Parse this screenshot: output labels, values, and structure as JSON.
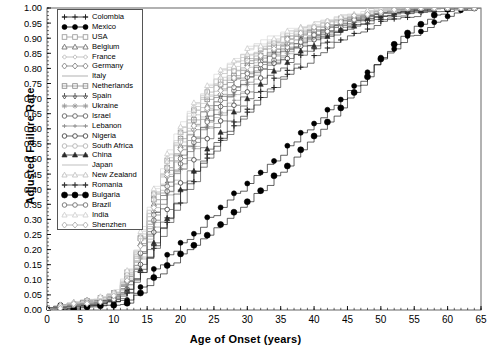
{
  "chart_data": {
    "type": "line",
    "subtype": "step-cumulative-incidence",
    "title": "",
    "xlabel": "Age of Onset (years)",
    "ylabel": "Adjusted Failure Rate",
    "xlim": [
      0,
      65
    ],
    "ylim": [
      0.0,
      1.0
    ],
    "xticks": [
      0,
      5,
      10,
      15,
      20,
      25,
      30,
      35,
      40,
      45,
      50,
      55,
      60,
      65
    ],
    "xtick_labels": [
      "0",
      "5",
      "10",
      "15",
      "20",
      "25",
      "30",
      "35",
      "40",
      "45",
      "50",
      "55",
      "60",
      "65"
    ],
    "x_minor_tick_interval": 1,
    "yticks": [
      0.0,
      0.05,
      0.1,
      0.15,
      0.2,
      0.25,
      0.3,
      0.35,
      0.4,
      0.45,
      0.5,
      0.55,
      0.6,
      0.65,
      0.7,
      0.75,
      0.8,
      0.85,
      0.9,
      0.95,
      1.0
    ],
    "ytick_labels": [
      "0.00",
      "0.05",
      "0.10",
      "0.15",
      "0.20",
      "0.25",
      "0.30",
      "0.35",
      "0.40",
      "0.45",
      "0.50",
      "0.55",
      "0.60",
      "0.65",
      "0.70",
      "0.75",
      "0.80",
      "0.85",
      "0.90",
      "0.95",
      "1.00"
    ],
    "grid": false,
    "legend_position": "upper-left",
    "x": [
      0,
      2,
      4,
      6,
      8,
      10,
      12,
      14,
      16,
      18,
      20,
      22,
      24,
      26,
      28,
      30,
      32,
      34,
      36,
      38,
      40,
      42,
      44,
      46,
      48,
      50,
      52,
      54,
      56,
      58,
      60,
      62,
      64,
      65
    ],
    "series": [
      {
        "name": "Colombia",
        "marker": "plus",
        "color": "#1a1a1a",
        "values": [
          0.0,
          0.01,
          0.01,
          0.02,
          0.02,
          0.03,
          0.06,
          0.13,
          0.22,
          0.31,
          0.39,
          0.46,
          0.52,
          0.57,
          0.62,
          0.66,
          0.7,
          0.74,
          0.78,
          0.81,
          0.84,
          0.87,
          0.89,
          0.91,
          0.93,
          0.95,
          0.96,
          0.97,
          0.98,
          0.99,
          0.99,
          1.0,
          1.0,
          1.0
        ]
      },
      {
        "name": "Mexico",
        "marker": "filled-circle",
        "color": "#000000",
        "values": [
          0.0,
          0.01,
          0.01,
          0.01,
          0.02,
          0.02,
          0.04,
          0.08,
          0.13,
          0.18,
          0.22,
          0.26,
          0.3,
          0.34,
          0.38,
          0.42,
          0.46,
          0.5,
          0.54,
          0.58,
          0.62,
          0.66,
          0.7,
          0.74,
          0.79,
          0.83,
          0.87,
          0.9,
          0.93,
          0.95,
          0.97,
          0.99,
          1.0,
          1.0
        ]
      },
      {
        "name": "USA",
        "marker": "open-square",
        "color": "#9a9a9a",
        "values": [
          0.0,
          0.01,
          0.02,
          0.03,
          0.04,
          0.06,
          0.12,
          0.24,
          0.38,
          0.5,
          0.59,
          0.66,
          0.72,
          0.76,
          0.8,
          0.83,
          0.86,
          0.88,
          0.9,
          0.92,
          0.93,
          0.95,
          0.96,
          0.97,
          0.98,
          0.98,
          0.99,
          0.99,
          1.0,
          1.0,
          1.0,
          1.0,
          1.0,
          1.0
        ]
      },
      {
        "name": "Belgium",
        "marker": "open-triangle",
        "color": "#6e6e6e",
        "values": [
          0.0,
          0.01,
          0.02,
          0.03,
          0.04,
          0.05,
          0.11,
          0.22,
          0.35,
          0.46,
          0.55,
          0.62,
          0.68,
          0.73,
          0.77,
          0.81,
          0.84,
          0.86,
          0.89,
          0.91,
          0.92,
          0.94,
          0.95,
          0.96,
          0.97,
          0.98,
          0.99,
          0.99,
          1.0,
          1.0,
          1.0,
          1.0,
          1.0,
          1.0
        ]
      },
      {
        "name": "France",
        "marker": "open-diamond-small",
        "color": "#b5b5b5",
        "values": [
          0.0,
          0.01,
          0.02,
          0.03,
          0.04,
          0.06,
          0.12,
          0.25,
          0.39,
          0.51,
          0.6,
          0.67,
          0.73,
          0.78,
          0.82,
          0.85,
          0.87,
          0.89,
          0.91,
          0.93,
          0.94,
          0.95,
          0.96,
          0.97,
          0.98,
          0.99,
          0.99,
          1.0,
          1.0,
          1.0,
          1.0,
          1.0,
          1.0,
          1.0
        ]
      },
      {
        "name": "Germany",
        "marker": "open-diamond",
        "color": "#7d7d7d",
        "values": [
          0.0,
          0.01,
          0.02,
          0.03,
          0.04,
          0.05,
          0.1,
          0.21,
          0.33,
          0.44,
          0.53,
          0.6,
          0.66,
          0.71,
          0.76,
          0.79,
          0.83,
          0.85,
          0.88,
          0.9,
          0.92,
          0.93,
          0.95,
          0.96,
          0.97,
          0.98,
          0.99,
          0.99,
          1.0,
          1.0,
          1.0,
          1.0,
          1.0,
          1.0
        ]
      },
      {
        "name": "Italy",
        "marker": "none",
        "color": "#c8c8c8",
        "values": [
          0.0,
          0.01,
          0.02,
          0.03,
          0.04,
          0.06,
          0.13,
          0.26,
          0.4,
          0.52,
          0.61,
          0.68,
          0.74,
          0.79,
          0.83,
          0.86,
          0.88,
          0.9,
          0.92,
          0.93,
          0.95,
          0.96,
          0.97,
          0.98,
          0.98,
          0.99,
          0.99,
          1.0,
          1.0,
          1.0,
          1.0,
          1.0,
          1.0,
          1.0
        ]
      },
      {
        "name": "Netherlands",
        "marker": "open-square-cross",
        "color": "#8a8a8a",
        "values": [
          0.0,
          0.01,
          0.02,
          0.03,
          0.04,
          0.05,
          0.11,
          0.23,
          0.36,
          0.47,
          0.56,
          0.63,
          0.69,
          0.74,
          0.78,
          0.82,
          0.85,
          0.87,
          0.89,
          0.91,
          0.93,
          0.94,
          0.96,
          0.97,
          0.97,
          0.98,
          0.99,
          0.99,
          1.0,
          1.0,
          1.0,
          1.0,
          1.0,
          1.0
        ]
      },
      {
        "name": "Spain",
        "marker": "down-arrow",
        "color": "#4d4d4d",
        "values": [
          0.0,
          0.01,
          0.02,
          0.02,
          0.03,
          0.05,
          0.1,
          0.2,
          0.32,
          0.43,
          0.51,
          0.58,
          0.64,
          0.7,
          0.74,
          0.78,
          0.82,
          0.85,
          0.87,
          0.9,
          0.91,
          0.93,
          0.95,
          0.96,
          0.97,
          0.98,
          0.98,
          0.99,
          0.99,
          1.0,
          1.0,
          1.0,
          1.0,
          1.0
        ]
      },
      {
        "name": "Ukraine",
        "marker": "star",
        "color": "#999999",
        "values": [
          0.0,
          0.01,
          0.01,
          0.02,
          0.03,
          0.04,
          0.09,
          0.18,
          0.29,
          0.39,
          0.47,
          0.54,
          0.61,
          0.66,
          0.71,
          0.75,
          0.79,
          0.82,
          0.85,
          0.88,
          0.9,
          0.92,
          0.94,
          0.95,
          0.96,
          0.97,
          0.98,
          0.99,
          0.99,
          1.0,
          1.0,
          1.0,
          1.0,
          1.0
        ]
      },
      {
        "name": "Israel",
        "marker": "open-circle",
        "color": "#5c5c5c",
        "values": [
          0.0,
          0.01,
          0.01,
          0.02,
          0.03,
          0.04,
          0.09,
          0.19,
          0.3,
          0.4,
          0.49,
          0.56,
          0.62,
          0.68,
          0.72,
          0.77,
          0.8,
          0.83,
          0.86,
          0.89,
          0.91,
          0.93,
          0.94,
          0.96,
          0.97,
          0.98,
          0.98,
          0.99,
          0.99,
          1.0,
          1.0,
          1.0,
          1.0,
          1.0
        ]
      },
      {
        "name": "Lebanon",
        "marker": "plus-small",
        "color": "#858585",
        "values": [
          0.0,
          0.01,
          0.01,
          0.02,
          0.03,
          0.04,
          0.08,
          0.17,
          0.28,
          0.38,
          0.46,
          0.53,
          0.6,
          0.65,
          0.7,
          0.75,
          0.79,
          0.82,
          0.85,
          0.88,
          0.9,
          0.92,
          0.94,
          0.95,
          0.96,
          0.97,
          0.98,
          0.99,
          0.99,
          1.0,
          1.0,
          1.0,
          1.0,
          1.0
        ]
      },
      {
        "name": "Nigeria",
        "marker": "open-circle-stem",
        "color": "#404040",
        "values": [
          0.0,
          0.0,
          0.01,
          0.01,
          0.02,
          0.03,
          0.07,
          0.15,
          0.25,
          0.34,
          0.42,
          0.5,
          0.57,
          0.63,
          0.68,
          0.73,
          0.77,
          0.81,
          0.84,
          0.87,
          0.89,
          0.91,
          0.93,
          0.95,
          0.96,
          0.97,
          0.98,
          0.99,
          0.99,
          1.0,
          1.0,
          1.0,
          1.0,
          1.0
        ]
      },
      {
        "name": "South Africa",
        "marker": "open-circle-light",
        "color": "#b0b0b0",
        "values": [
          0.0,
          0.01,
          0.02,
          0.03,
          0.04,
          0.05,
          0.11,
          0.23,
          0.36,
          0.47,
          0.56,
          0.64,
          0.7,
          0.75,
          0.79,
          0.83,
          0.86,
          0.88,
          0.9,
          0.92,
          0.94,
          0.95,
          0.96,
          0.97,
          0.98,
          0.99,
          0.99,
          1.0,
          1.0,
          1.0,
          1.0,
          1.0,
          1.0,
          1.0
        ]
      },
      {
        "name": "China",
        "marker": "filled-triangle",
        "color": "#2b2b2b",
        "values": [
          0.0,
          0.0,
          0.01,
          0.01,
          0.02,
          0.03,
          0.06,
          0.13,
          0.22,
          0.31,
          0.39,
          0.46,
          0.53,
          0.59,
          0.65,
          0.7,
          0.75,
          0.79,
          0.82,
          0.86,
          0.88,
          0.91,
          0.93,
          0.94,
          0.96,
          0.97,
          0.98,
          0.99,
          0.99,
          1.0,
          1.0,
          1.0,
          1.0,
          1.0
        ]
      },
      {
        "name": "Japan",
        "marker": "none-light",
        "color": "#d2d2d2",
        "values": [
          0.0,
          0.01,
          0.02,
          0.03,
          0.04,
          0.06,
          0.13,
          0.27,
          0.41,
          0.53,
          0.62,
          0.69,
          0.75,
          0.8,
          0.84,
          0.87,
          0.89,
          0.91,
          0.93,
          0.94,
          0.95,
          0.96,
          0.97,
          0.98,
          0.99,
          0.99,
          1.0,
          1.0,
          1.0,
          1.0,
          1.0,
          1.0,
          1.0,
          1.0
        ]
      },
      {
        "name": "New Zealand",
        "marker": "open-triangle-light",
        "color": "#c0c0c0",
        "values": [
          0.0,
          0.01,
          0.02,
          0.03,
          0.04,
          0.06,
          0.12,
          0.25,
          0.39,
          0.5,
          0.59,
          0.66,
          0.72,
          0.77,
          0.81,
          0.84,
          0.87,
          0.89,
          0.91,
          0.93,
          0.94,
          0.95,
          0.96,
          0.97,
          0.98,
          0.99,
          0.99,
          1.0,
          1.0,
          1.0,
          1.0,
          1.0,
          1.0,
          1.0
        ]
      },
      {
        "name": "Romania",
        "marker": "plus-bold",
        "color": "#333333",
        "values": [
          0.0,
          0.0,
          0.01,
          0.01,
          0.02,
          0.03,
          0.06,
          0.13,
          0.21,
          0.29,
          0.36,
          0.43,
          0.5,
          0.56,
          0.61,
          0.67,
          0.72,
          0.76,
          0.8,
          0.84,
          0.87,
          0.89,
          0.92,
          0.94,
          0.95,
          0.96,
          0.98,
          0.98,
          0.99,
          1.0,
          1.0,
          1.0,
          1.0,
          1.0
        ]
      },
      {
        "name": "Bulgaria",
        "marker": "filled-circle-large",
        "color": "#000000",
        "values": [
          0.0,
          0.0,
          0.0,
          0.01,
          0.01,
          0.02,
          0.03,
          0.06,
          0.1,
          0.14,
          0.18,
          0.21,
          0.25,
          0.28,
          0.32,
          0.36,
          0.4,
          0.44,
          0.48,
          0.53,
          0.57,
          0.62,
          0.67,
          0.72,
          0.78,
          0.83,
          0.88,
          0.92,
          0.95,
          0.97,
          0.99,
          1.0,
          1.0,
          1.0
        ]
      },
      {
        "name": "Brazil",
        "marker": "open-circle-dash",
        "color": "#6a6a6a",
        "values": [
          0.0,
          0.01,
          0.01,
          0.02,
          0.03,
          0.04,
          0.09,
          0.19,
          0.31,
          0.41,
          0.5,
          0.57,
          0.63,
          0.69,
          0.73,
          0.78,
          0.81,
          0.84,
          0.87,
          0.89,
          0.91,
          0.93,
          0.95,
          0.96,
          0.97,
          0.98,
          0.99,
          0.99,
          1.0,
          1.0,
          1.0,
          1.0,
          1.0,
          1.0
        ]
      },
      {
        "name": "India",
        "marker": "open-triangle-faint",
        "color": "#cfcfcf",
        "values": [
          0.0,
          0.01,
          0.02,
          0.03,
          0.04,
          0.06,
          0.13,
          0.26,
          0.4,
          0.51,
          0.61,
          0.68,
          0.74,
          0.79,
          0.83,
          0.86,
          0.88,
          0.9,
          0.92,
          0.94,
          0.95,
          0.96,
          0.97,
          0.98,
          0.99,
          0.99,
          1.0,
          1.0,
          1.0,
          1.0,
          1.0,
          1.0,
          1.0,
          1.0
        ]
      },
      {
        "name": "Shenzhen",
        "marker": "open-diamond-faint",
        "color": "#a8a8a8",
        "values": [
          0.0,
          0.01,
          0.02,
          0.02,
          0.03,
          0.05,
          0.1,
          0.21,
          0.34,
          0.45,
          0.54,
          0.61,
          0.67,
          0.72,
          0.77,
          0.81,
          0.84,
          0.87,
          0.89,
          0.91,
          0.93,
          0.94,
          0.96,
          0.97,
          0.98,
          0.98,
          0.99,
          1.0,
          1.0,
          1.0,
          1.0,
          1.0,
          1.0,
          1.0
        ]
      }
    ]
  },
  "axes": {
    "x_title": "Age of Onset (years)",
    "y_title": "Adjusted Failure Rate"
  },
  "legend": {
    "entries": [
      {
        "label": "Colombia"
      },
      {
        "label": "Mexico"
      },
      {
        "label": "USA"
      },
      {
        "label": "Belgium"
      },
      {
        "label": "France"
      },
      {
        "label": "Germany"
      },
      {
        "label": "Italy"
      },
      {
        "label": "Netherlands"
      },
      {
        "label": "Spain"
      },
      {
        "label": "Ukraine"
      },
      {
        "label": "Israel"
      },
      {
        "label": "Lebanon"
      },
      {
        "label": "Nigeria"
      },
      {
        "label": "South Africa"
      },
      {
        "label": "China"
      },
      {
        "label": "Japan"
      },
      {
        "label": "New Zealand"
      },
      {
        "label": "Romania"
      },
      {
        "label": "Bulgaria"
      },
      {
        "label": "Brazil"
      },
      {
        "label": "India"
      },
      {
        "label": "Shenzhen"
      }
    ]
  },
  "colors": {
    "axis": "#000000",
    "background": "#ffffff",
    "frame": "#555555"
  }
}
